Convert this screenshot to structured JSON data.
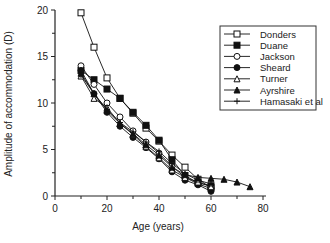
{
  "chart_data": {
    "type": "line",
    "title": "",
    "xlabel": "Age  (years)",
    "ylabel": "Amplitude  of  accommodation  (D)",
    "xlim": [
      0,
      80
    ],
    "ylim": [
      0,
      20
    ],
    "xticks": [
      0,
      20,
      40,
      60,
      80
    ],
    "yticks": [
      0,
      5,
      10,
      15,
      20
    ],
    "grid": false,
    "legend_position": "upper right",
    "series": [
      {
        "name": "Donders",
        "marker": "open-square",
        "x": [
          10,
          15,
          20,
          25,
          30,
          35,
          40,
          45,
          50,
          55,
          60
        ],
        "y": [
          19.7,
          16.0,
          12.7,
          10.5,
          8.9,
          7.3,
          5.9,
          4.4,
          3.1,
          1.8,
          0.9
        ]
      },
      {
        "name": "Duane",
        "marker": "filled-square",
        "x": [
          10,
          15,
          20,
          25,
          30,
          35,
          40,
          45,
          50,
          55,
          60
        ],
        "y": [
          13.5,
          12.5,
          11.5,
          10.5,
          9.0,
          7.6,
          6.0,
          3.9,
          2.2,
          1.4,
          1.1
        ]
      },
      {
        "name": "Jackson",
        "marker": "open-circle",
        "x": [
          10,
          15,
          20,
          25,
          30,
          35,
          40,
          45,
          50,
          55,
          60
        ],
        "y": [
          14.0,
          12.0,
          10.0,
          8.5,
          7.0,
          5.8,
          4.6,
          3.2,
          2.0,
          1.3,
          0.8
        ]
      },
      {
        "name": "Sheard",
        "marker": "filled-circle",
        "x": [
          10,
          15,
          20,
          25,
          30,
          35,
          40,
          45,
          50,
          55,
          60
        ],
        "y": [
          13.5,
          11.0,
          9.0,
          7.5,
          6.3,
          5.2,
          4.0,
          2.6,
          1.7,
          1.2,
          0.5
        ]
      },
      {
        "name": "Turner",
        "marker": "open-triangle",
        "x": [
          10,
          15,
          20,
          25,
          30,
          35,
          40,
          45,
          50,
          55,
          60
        ],
        "y": [
          12.9,
          10.5,
          9.5,
          7.8,
          6.6,
          5.3,
          4.1,
          2.8,
          2.0,
          1.5,
          1.0
        ]
      },
      {
        "name": "Ayrshire",
        "marker": "filled-triangle",
        "x": [
          10,
          15,
          20,
          25,
          30,
          35,
          40,
          45,
          50,
          55,
          60,
          65,
          70,
          75
        ],
        "y": [
          13.2,
          11.0,
          9.2,
          7.8,
          6.7,
          5.5,
          4.4,
          3.1,
          2.3,
          2.0,
          1.9,
          1.8,
          1.5,
          1.0
        ]
      },
      {
        "name": "Hamasaki et al",
        "marker": "plus",
        "x": [
          10,
          15,
          20,
          25,
          30,
          35,
          40,
          45,
          50,
          55,
          60
        ],
        "y": [
          13.0,
          11.0,
          9.3,
          7.9,
          6.9,
          5.8,
          4.8,
          3.5,
          2.4,
          1.7,
          1.3
        ]
      }
    ]
  }
}
